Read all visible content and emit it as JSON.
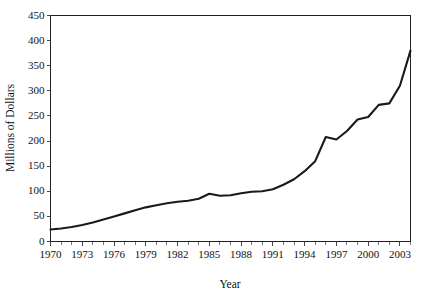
{
  "chart_data": {
    "type": "line",
    "title": "",
    "xlabel": "Year",
    "ylabel": "Millions of Dollars",
    "xlim": [
      1970,
      2004
    ],
    "ylim": [
      0,
      450
    ],
    "grid": false,
    "legend": false,
    "y_ticks": [
      0,
      50,
      100,
      150,
      200,
      250,
      300,
      350,
      400,
      450
    ],
    "y_tick_labels": [
      "0",
      "50",
      "100",
      "150",
      "200",
      "250",
      "300",
      "350",
      "400",
      "450"
    ],
    "x_ticks": [
      1970,
      1973,
      1976,
      1979,
      1982,
      1985,
      1988,
      1991,
      1994,
      1997,
      2000,
      2003
    ],
    "x_tick_labels": [
      "1970",
      "1973",
      "1976",
      "1979",
      "1982",
      "1985",
      "1988",
      "1991",
      "1994",
      "1997",
      "2000",
      "2003"
    ],
    "x_minor_tick_interval": 1,
    "series_color": "#1a1a1a",
    "x": [
      1970,
      1971,
      1972,
      1973,
      1974,
      1975,
      1976,
      1977,
      1978,
      1979,
      1980,
      1981,
      1982,
      1983,
      1984,
      1985,
      1986,
      1987,
      1988,
      1989,
      1990,
      1991,
      1992,
      1993,
      1994,
      1995,
      1996,
      1997,
      1998,
      1999,
      2000,
      2001,
      2002,
      2003,
      2004
    ],
    "values": [
      24,
      26,
      29,
      33,
      38,
      44,
      50,
      56,
      62,
      68,
      72,
      76,
      79,
      81,
      85,
      95,
      91,
      92,
      96,
      99,
      100,
      104,
      113,
      124,
      140,
      160,
      208,
      203,
      220,
      243,
      248,
      272,
      275,
      310,
      380
    ],
    "series": [
      {
        "name": "Millions of Dollars",
        "values": [
          24,
          26,
          29,
          33,
          38,
          44,
          50,
          56,
          62,
          68,
          72,
          76,
          79,
          81,
          85,
          95,
          91,
          92,
          96,
          99,
          100,
          104,
          113,
          124,
          140,
          160,
          208,
          203,
          220,
          243,
          248,
          272,
          275,
          310,
          380
        ]
      }
    ]
  },
  "axes": {
    "x_title": "Year",
    "y_title": "Millions of Dollars"
  }
}
